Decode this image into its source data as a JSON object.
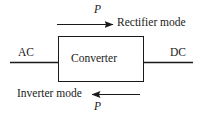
{
  "diagram": {
    "block": {
      "label": "Converter",
      "x": 58,
      "y": 36,
      "width": 85,
      "height": 45,
      "stroke": "#1a1a1a"
    },
    "terminals": [
      {
        "name": "ac-terminal",
        "label": "AC",
        "side": "left"
      },
      {
        "name": "dc-terminal",
        "label": "DC",
        "side": "right"
      }
    ],
    "flows": [
      {
        "name": "rectifier-flow",
        "label": "Rectifier mode",
        "quantity": "P",
        "direction": "right",
        "position": "top"
      },
      {
        "name": "inverter-flow",
        "label": "Inverter mode",
        "quantity": "P",
        "direction": "left",
        "position": "bottom"
      }
    ],
    "colors": {
      "line": "#1a1a1a",
      "background": "#ffffff",
      "text": "#1a1a1a"
    }
  }
}
